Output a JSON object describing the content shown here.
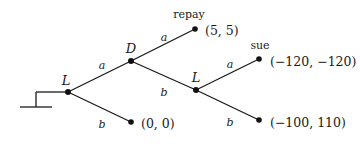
{
  "diagram": {
    "type": "extensive-form game tree",
    "root_marker": {
      "base": {
        "x1": 20,
        "x2": 52,
        "y": 107
      },
      "stem": {
        "x": 36,
        "y1": 107,
        "y2": 92
      }
    },
    "nodes": [
      {
        "id": "n0",
        "player": "L",
        "x": 68,
        "y": 92,
        "label_x": 66,
        "label_y": 80
      },
      {
        "id": "n1",
        "player": "D",
        "x": 131,
        "y": 61,
        "label_x": 131,
        "label_y": 48
      },
      {
        "id": "n2",
        "player": "L",
        "x": 196,
        "y": 90,
        "label_x": 196,
        "label_y": 77
      }
    ],
    "terminals": [
      {
        "id": "t_repay",
        "name": "repay",
        "payoff": "(5, 5)",
        "x": 195,
        "y": 29,
        "name_x": 189,
        "name_y": 14,
        "payoff_x": 205,
        "payoff_y": 31
      },
      {
        "id": "t_sue",
        "name": "sue",
        "payoff": "(−120, −120)",
        "x": 259,
        "y": 59,
        "name_x": 260,
        "name_y": 45,
        "payoff_x": 270,
        "payoff_y": 62
      },
      {
        "id": "t_00",
        "name": "",
        "payoff": "(0, 0)",
        "x": 131,
        "y": 122,
        "name_x": 0,
        "name_y": 0,
        "payoff_x": 141,
        "payoff_y": 124
      },
      {
        "id": "t_lb",
        "name": "",
        "payoff": "(−100, 110)",
        "x": 259,
        "y": 120,
        "name_x": 0,
        "name_y": 0,
        "payoff_x": 270,
        "payoff_y": 123
      }
    ],
    "edges": [
      {
        "from": "n0",
        "to": "n1",
        "action": "a",
        "label_x": 102,
        "label_y": 65
      },
      {
        "from": "n0",
        "to": "t_00",
        "action": "b",
        "label_x": 102,
        "label_y": 124
      },
      {
        "from": "n1",
        "to": "t_repay",
        "action": "a",
        "label_x": 164,
        "label_y": 37
      },
      {
        "from": "n1",
        "to": "n2",
        "action": "b",
        "label_x": 164,
        "label_y": 92
      },
      {
        "from": "n2",
        "to": "t_sue",
        "action": "a",
        "label_x": 230,
        "label_y": 64
      },
      {
        "from": "n2",
        "to": "t_lb",
        "action": "b",
        "label_x": 230,
        "label_y": 122
      }
    ]
  },
  "labels": {
    "root_player": "L",
    "d_player": "D",
    "second_l_player": "L",
    "edge_root_a": "a",
    "edge_root_b": "b",
    "edge_d_a": "a",
    "edge_d_b": "b",
    "edge_l2_a": "a",
    "edge_l2_b": "b",
    "repay_name": "repay",
    "repay_payoff": "(5, 5)",
    "sue_name": "sue",
    "sue_payoff": "(−120, −120)",
    "root_b_payoff": "(0, 0)",
    "l2_b_payoff": "(−100, 110)"
  },
  "colors": {
    "ink": "#1a1a1a",
    "background": "#ffffff"
  }
}
